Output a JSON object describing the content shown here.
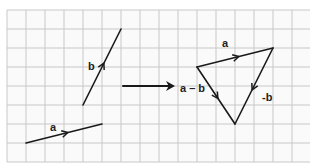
{
  "diagram": {
    "grid": {
      "origin_x": 7,
      "origin_y": 10,
      "cell": 19,
      "cols": 16,
      "rows": 8,
      "color": "#c8c8c8",
      "background": "#fafafa"
    },
    "stroke_color": "#1a1a1a",
    "left_vectors": [
      {
        "name": "a",
        "label": "a",
        "from": [
          26,
          143
        ],
        "to": [
          102,
          124
        ],
        "label_pos": [
          50,
          131
        ]
      },
      {
        "name": "b",
        "label": "b",
        "from": [
          83,
          105
        ],
        "to": [
          121,
          29
        ],
        "label_pos": [
          88,
          70
        ]
      }
    ],
    "transition_arrow": {
      "from": [
        123,
        86
      ],
      "to": [
        175,
        86
      ]
    },
    "triangle": {
      "vertices": {
        "start": [
          197,
          67
        ],
        "top_right": [
          273,
          48
        ],
        "bottom": [
          235,
          124
        ]
      },
      "edges": [
        {
          "name": "a",
          "label": "a",
          "from": [
            197,
            67
          ],
          "to": [
            273,
            48
          ],
          "label_pos": [
            222,
            47
          ]
        },
        {
          "name": "neg-b",
          "label": "-b",
          "from": [
            273,
            48
          ],
          "to": [
            235,
            124
          ],
          "label_pos": [
            262,
            101
          ]
        },
        {
          "name": "a-minus-b",
          "label": "a – b",
          "from": [
            197,
            67
          ],
          "to": [
            235,
            124
          ],
          "label_pos": [
            180,
            92
          ]
        }
      ]
    }
  }
}
